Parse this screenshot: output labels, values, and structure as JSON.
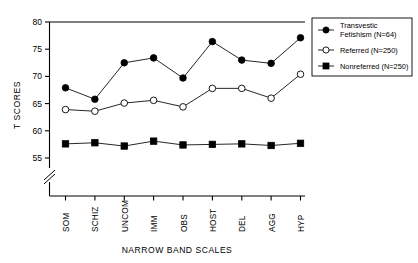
{
  "chart_data": {
    "type": "line",
    "title": "",
    "xlabel": "NARROW BAND SCALES",
    "ylabel": "T SCORES",
    "categories": [
      "SOM",
      "SCHIZ",
      "UNCOM",
      "IMM",
      "OBS",
      "HOST",
      "DEL",
      "AGG",
      "HYP"
    ],
    "ylim": [
      55,
      80
    ],
    "yticks": [
      55,
      60,
      65,
      70,
      75,
      80
    ],
    "axis_break": true,
    "grid": false,
    "legend_position": "right",
    "series": [
      {
        "name": "Transvestic Fetishism (N=64)",
        "marker": "filled-circle",
        "values": [
          67.9,
          65.8,
          72.5,
          73.4,
          69.7,
          76.4,
          73.0,
          72.4,
          77.1
        ]
      },
      {
        "name": "Referred (N=250)",
        "marker": "open-circle",
        "values": [
          63.9,
          63.6,
          65.1,
          65.6,
          64.4,
          67.8,
          67.8,
          66.0,
          70.4
        ]
      },
      {
        "name": "Nonreferred (N=250)",
        "marker": "filled-square",
        "values": [
          57.6,
          57.8,
          57.2,
          58.1,
          57.4,
          57.5,
          57.6,
          57.3,
          57.7
        ]
      }
    ]
  },
  "legend": {
    "entries": [
      {
        "label_line1": "Transvestic",
        "label_line2": "Fetishism (N=64)"
      },
      {
        "label_line1": "Referred (N=250)",
        "label_line2": ""
      },
      {
        "label_line1": "Nonreferred (N=250)",
        "label_line2": ""
      }
    ]
  },
  "axes": {
    "ytick_0": "55",
    "ytick_1": "60",
    "ytick_2": "65",
    "ytick_3": "70",
    "ytick_4": "75",
    "ytick_5": "80",
    "y_title": "T SCORES",
    "x_title": "NARROW BAND SCALES",
    "xtick_0": "SOM",
    "xtick_1": "SCHIZ",
    "xtick_2": "UNCOM",
    "xtick_3": "IMM",
    "xtick_4": "OBS",
    "xtick_5": "HOST",
    "xtick_6": "DEL",
    "xtick_7": "AGG",
    "xtick_8": "HYP"
  }
}
